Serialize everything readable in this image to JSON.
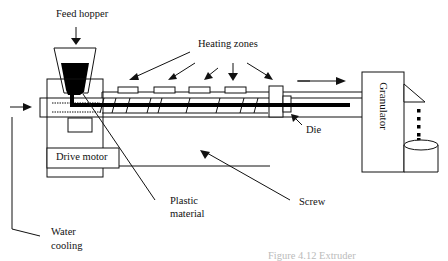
{
  "diagram": {
    "type": "process schematic",
    "labels": {
      "feed_hopper": "Feed hopper",
      "heating_zones": "Heating zones",
      "die": "Die",
      "granulator": "Granulator",
      "drive_motor": "Drive motor",
      "plastic_material": "Plastic\nmaterial",
      "plastic_line1": "Plastic",
      "plastic_line2": "material",
      "screw": "Screw",
      "water_line1": "Water",
      "water_line2": "cooling"
    },
    "caption": "Figure 4.12 Extruder",
    "heater_count": 5,
    "colors": {
      "line": "#111111",
      "fill": "#000000",
      "background": "#ffffff"
    }
  }
}
